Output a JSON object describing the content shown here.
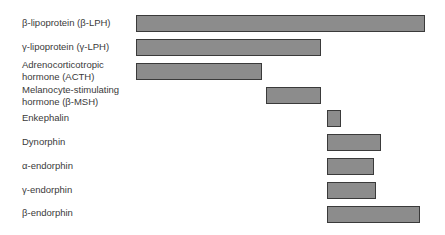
{
  "diagram": {
    "title": "",
    "bar_fill": "#8c8c8c",
    "bar_border": "#3a3a3a",
    "rows": [
      {
        "label": "β-lipoprotein (β-LPH)",
        "label_lines": [
          "β-lipoprotein (β-LPH)"
        ],
        "start": 136,
        "end": 425
      },
      {
        "label": "γ-lipoprotein (γ-LPH)",
        "label_lines": [
          "γ-lipoprotein (γ-LPH)"
        ],
        "start": 136,
        "end": 321
      },
      {
        "label": "Adrenocorticotropic hormone (ACTH)",
        "label_lines": [
          "Adrenocorticotropic",
          "hormone (ACTH)"
        ],
        "start": 136,
        "end": 262
      },
      {
        "label": "Melanocyte-stimulating hormone (β-MSH)",
        "label_lines": [
          "Melanocyte-stimulating",
          "hormone (β-MSH)"
        ],
        "start": 266,
        "end": 321
      },
      {
        "label": "Enkephalin",
        "label_lines": [
          "Enkephalin"
        ],
        "start": 327,
        "end": 341
      },
      {
        "label": "Dynorphin",
        "label_lines": [
          "Dynorphin"
        ],
        "start": 327,
        "end": 381
      },
      {
        "label": "α-endorphin",
        "label_lines": [
          "α-endorphin"
        ],
        "start": 327,
        "end": 374
      },
      {
        "label": "γ-endorphin",
        "label_lines": [
          "γ-endorphin"
        ],
        "start": 327,
        "end": 376
      },
      {
        "label": "β-endorphin",
        "label_lines": [
          "β-endorphin"
        ],
        "start": 327,
        "end": 420
      }
    ]
  }
}
